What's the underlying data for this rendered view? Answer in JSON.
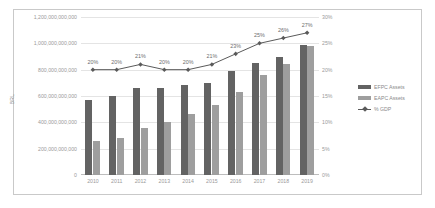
{
  "chart_data": {
    "type": "bar",
    "title": "",
    "xlabel": "",
    "ylabel": "BRL",
    "y2label": "",
    "categories": [
      "2010",
      "2011",
      "2012",
      "2013",
      "2014",
      "2015",
      "2016",
      "2017",
      "2018",
      "2019"
    ],
    "series": [
      {
        "name": "EFPC Assets",
        "type": "bar",
        "color": "#636363",
        "axis": "left",
        "values": [
          570000000000,
          600000000000,
          660000000000,
          660000000000,
          680000000000,
          700000000000,
          790000000000,
          850000000000,
          900000000000,
          990000000000
        ]
      },
      {
        "name": "EAPC Assets",
        "type": "bar",
        "color": "#9e9e9e",
        "axis": "left",
        "values": [
          260000000000,
          280000000000,
          360000000000,
          400000000000,
          460000000000,
          530000000000,
          630000000000,
          760000000000,
          840000000000,
          980000000000
        ]
      },
      {
        "name": "% GDP",
        "type": "line",
        "color": "#5a5a5a",
        "axis": "right",
        "values": [
          20,
          20,
          21,
          20,
          20,
          21,
          23,
          25,
          26,
          27
        ],
        "point_labels": [
          "20%",
          "20%",
          "21%",
          "20%",
          "20%",
          "21%",
          "23%",
          "25%",
          "26%",
          "27%"
        ]
      }
    ],
    "ylim": [
      0,
      1200000000000
    ],
    "yticks": [
      "0",
      "200,000,000,000",
      "400,000,000,000",
      "600,000,000,000",
      "800,000,000,000",
      "1,000,000,000,000",
      "1,200,000,000,000"
    ],
    "y2lim": [
      0,
      30
    ],
    "y2ticks": [
      "0%",
      "5%",
      "10%",
      "15%",
      "20%",
      "25%",
      "30%"
    ],
    "grid": true,
    "legend_position": "right"
  },
  "legend": {
    "items": [
      {
        "label": "EFPC Assets",
        "marker": "bar-swatch-dark"
      },
      {
        "label": "EAPC Assets",
        "marker": "bar-swatch-light"
      },
      {
        "label": "% GDP",
        "marker": "line-marker"
      }
    ]
  }
}
